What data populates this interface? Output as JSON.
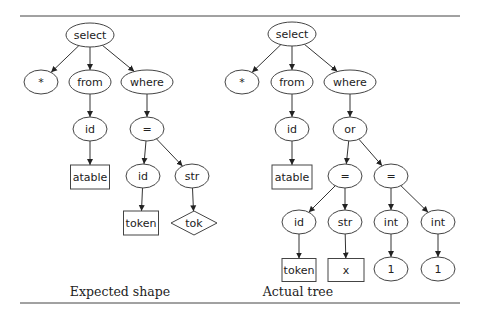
{
  "figure": {
    "colors": {
      "stroke": "#444444",
      "text": "#222222",
      "background": "#ffffff"
    },
    "panels": [
      {
        "caption": "Expected shape",
        "nodes": [
          {
            "id": "l_select",
            "label": "select",
            "shape": "ellipse",
            "x": 90,
            "y": 35,
            "rx": 24,
            "ry": 12
          },
          {
            "id": "l_star",
            "label": "*",
            "shape": "ellipse",
            "x": 41,
            "y": 82,
            "rx": 17,
            "ry": 12
          },
          {
            "id": "l_from",
            "label": "from",
            "shape": "ellipse",
            "x": 90,
            "y": 82,
            "rx": 21,
            "ry": 12
          },
          {
            "id": "l_where",
            "label": "where",
            "shape": "ellipse",
            "x": 147,
            "y": 82,
            "rx": 26,
            "ry": 12
          },
          {
            "id": "l_id",
            "label": "id",
            "shape": "ellipse",
            "x": 90,
            "y": 129,
            "rx": 17,
            "ry": 12
          },
          {
            "id": "l_eq",
            "label": "=",
            "shape": "ellipse",
            "x": 147,
            "y": 129,
            "rx": 17,
            "ry": 12
          },
          {
            "id": "l_atable",
            "label": "atable",
            "shape": "box",
            "x": 90,
            "y": 177,
            "w": 39,
            "h": 24
          },
          {
            "id": "l_id2",
            "label": "id",
            "shape": "ellipse",
            "x": 143,
            "y": 176,
            "rx": 17,
            "ry": 12
          },
          {
            "id": "l_str",
            "label": "str",
            "shape": "ellipse",
            "x": 192,
            "y": 176,
            "rx": 17,
            "ry": 12
          },
          {
            "id": "l_token",
            "label": "token",
            "shape": "box",
            "x": 141,
            "y": 223,
            "w": 35,
            "h": 24
          },
          {
            "id": "l_tok",
            "label": "tok",
            "shape": "diamond",
            "x": 194,
            "y": 223,
            "w": 46,
            "h": 24
          }
        ],
        "edges": [
          [
            "l_select",
            "l_star"
          ],
          [
            "l_select",
            "l_from"
          ],
          [
            "l_select",
            "l_where"
          ],
          [
            "l_from",
            "l_id"
          ],
          [
            "l_where",
            "l_eq"
          ],
          [
            "l_id",
            "l_atable"
          ],
          [
            "l_eq",
            "l_id2"
          ],
          [
            "l_eq",
            "l_str"
          ],
          [
            "l_id2",
            "l_token"
          ],
          [
            "l_str",
            "l_tok"
          ]
        ]
      },
      {
        "caption": "Actual tree",
        "nodes": [
          {
            "id": "r_select",
            "label": "select",
            "shape": "ellipse",
            "x": 292,
            "y": 34,
            "rx": 24,
            "ry": 12
          },
          {
            "id": "r_star",
            "label": "*",
            "shape": "ellipse",
            "x": 242,
            "y": 82,
            "rx": 17,
            "ry": 12
          },
          {
            "id": "r_from",
            "label": "from",
            "shape": "ellipse",
            "x": 292,
            "y": 82,
            "rx": 21,
            "ry": 12
          },
          {
            "id": "r_where",
            "label": "where",
            "shape": "ellipse",
            "x": 350,
            "y": 82,
            "rx": 26,
            "ry": 12
          },
          {
            "id": "r_id",
            "label": "id",
            "shape": "ellipse",
            "x": 292,
            "y": 129,
            "rx": 17,
            "ry": 12
          },
          {
            "id": "r_or",
            "label": "or",
            "shape": "ellipse",
            "x": 350,
            "y": 129,
            "rx": 17,
            "ry": 12
          },
          {
            "id": "r_atable",
            "label": "atable",
            "shape": "box",
            "x": 292,
            "y": 177,
            "w": 40,
            "h": 24
          },
          {
            "id": "r_eq1",
            "label": "=",
            "shape": "ellipse",
            "x": 345,
            "y": 176,
            "rx": 17,
            "ry": 12
          },
          {
            "id": "r_eq2",
            "label": "=",
            "shape": "ellipse",
            "x": 391,
            "y": 176,
            "rx": 17,
            "ry": 12
          },
          {
            "id": "r_id2",
            "label": "id",
            "shape": "ellipse",
            "x": 299,
            "y": 222,
            "rx": 17,
            "ry": 12
          },
          {
            "id": "r_str",
            "label": "str",
            "shape": "ellipse",
            "x": 345,
            "y": 222,
            "rx": 17,
            "ry": 12
          },
          {
            "id": "r_int1",
            "label": "int",
            "shape": "ellipse",
            "x": 391,
            "y": 222,
            "rx": 17,
            "ry": 12
          },
          {
            "id": "r_int2",
            "label": "int",
            "shape": "ellipse",
            "x": 438,
            "y": 222,
            "rx": 17,
            "ry": 12
          },
          {
            "id": "r_token",
            "label": "token",
            "shape": "box",
            "x": 299,
            "y": 270,
            "w": 34,
            "h": 23
          },
          {
            "id": "r_x",
            "label": "x",
            "shape": "box",
            "x": 346,
            "y": 270,
            "w": 36,
            "h": 23
          },
          {
            "id": "r_one1",
            "label": "1",
            "shape": "ellipse",
            "x": 391,
            "y": 269,
            "rx": 17,
            "ry": 12
          },
          {
            "id": "r_one2",
            "label": "1",
            "shape": "ellipse",
            "x": 438,
            "y": 269,
            "rx": 17,
            "ry": 12
          }
        ],
        "edges": [
          [
            "r_select",
            "r_star"
          ],
          [
            "r_select",
            "r_from"
          ],
          [
            "r_select",
            "r_where"
          ],
          [
            "r_from",
            "r_id"
          ],
          [
            "r_where",
            "r_or"
          ],
          [
            "r_id",
            "r_atable"
          ],
          [
            "r_or",
            "r_eq1"
          ],
          [
            "r_or",
            "r_eq2"
          ],
          [
            "r_eq1",
            "r_id2"
          ],
          [
            "r_eq1",
            "r_str"
          ],
          [
            "r_eq2",
            "r_int1"
          ],
          [
            "r_eq2",
            "r_int2"
          ],
          [
            "r_id2",
            "r_token"
          ],
          [
            "r_str",
            "r_x"
          ],
          [
            "r_int1",
            "r_one1"
          ],
          [
            "r_int2",
            "r_one2"
          ]
        ]
      }
    ]
  },
  "captions": {
    "left": "Expected shape",
    "right": "Actual tree"
  }
}
